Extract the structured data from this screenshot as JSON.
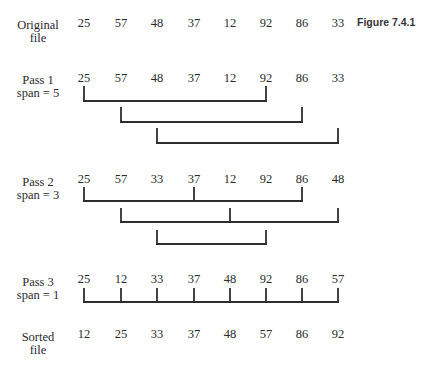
{
  "caption": "Figure 7.4.1",
  "column_x": [
    84,
    121,
    157,
    194,
    230,
    266,
    302,
    338
  ],
  "rows": [
    {
      "id": "original",
      "label_line1": "Original",
      "label_line2": "file",
      "label_top": 19,
      "num_top": 17,
      "values": [
        "25",
        "57",
        "48",
        "37",
        "12",
        "92",
        "86",
        "33"
      ]
    },
    {
      "id": "pass1",
      "label_line1": "Pass 1",
      "label_line2": "span = 5",
      "label_top": 74,
      "num_top": 72,
      "values": [
        "25",
        "57",
        "48",
        "37",
        "12",
        "92",
        "86",
        "33"
      ]
    },
    {
      "id": "pass2",
      "label_line1": "Pass 2",
      "label_line2": "span = 3",
      "label_top": 176,
      "num_top": 173,
      "values": [
        "25",
        "57",
        "33",
        "37",
        "12",
        "92",
        "86",
        "48"
      ]
    },
    {
      "id": "pass3",
      "label_line1": "Pass 3",
      "label_line2": "span = 1",
      "label_top": 276,
      "num_top": 273,
      "values": [
        "25",
        "12",
        "33",
        "37",
        "48",
        "92",
        "86",
        "57"
      ]
    },
    {
      "id": "sorted",
      "label_line1": "Sorted",
      "label_line2": "file",
      "label_top": 331,
      "num_top": 328,
      "values": [
        "12",
        "25",
        "33",
        "37",
        "48",
        "57",
        "86",
        "92"
      ]
    }
  ],
  "brackets": [
    {
      "pass": 1,
      "group": 1,
      "columns": [
        0,
        5
      ],
      "line_y": 101,
      "tick_top": 87
    },
    {
      "pass": 1,
      "group": 2,
      "columns": [
        1,
        6
      ],
      "line_y": 122,
      "tick_top": 108
    },
    {
      "pass": 1,
      "group": 3,
      "columns": [
        2,
        7
      ],
      "line_y": 143,
      "tick_top": 129
    },
    {
      "pass": 2,
      "group": 1,
      "columns": [
        0,
        3,
        6
      ],
      "line_y": 201,
      "tick_top": 188
    },
    {
      "pass": 2,
      "group": 2,
      "columns": [
        1,
        4,
        7
      ],
      "line_y": 222,
      "tick_top": 209
    },
    {
      "pass": 2,
      "group": 3,
      "columns": [
        2,
        5
      ],
      "line_y": 244,
      "tick_top": 231
    },
    {
      "pass": 3,
      "group": 1,
      "columns": [
        0,
        1,
        2,
        3,
        4,
        5,
        6,
        7
      ],
      "line_y": 302,
      "tick_top": 289
    }
  ]
}
